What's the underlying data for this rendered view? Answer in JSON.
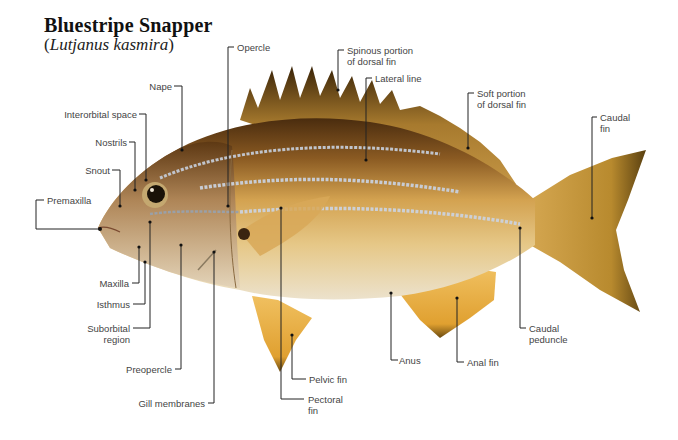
{
  "title": "Bluestripe Snapper",
  "subtitle_open": "(",
  "subtitle_species": "Lutjanus kasmira",
  "subtitle_close": ")",
  "labels": {
    "opercle": "Opercle",
    "spinous_dorsal_1": "Spinous portion",
    "spinous_dorsal_2": "of dorsal fin",
    "lateral_line": "Lateral line",
    "soft_dorsal_1": "Soft portion",
    "soft_dorsal_2": "of dorsal fin",
    "caudal_fin_1": "Caudal",
    "caudal_fin_2": "fin",
    "nape": "Nape",
    "interorbital": "Interorbital space",
    "nostrils": "Nostrils",
    "snout": "Snout",
    "premaxilla": "Premaxilla",
    "maxilla": "Maxilla",
    "isthmus": "Isthmus",
    "suborbital_1": "Suborbital",
    "suborbital_2": "region",
    "preopercle": "Preopercle",
    "gill_membranes": "Gill membranes",
    "pelvic_fin": "Pelvic fin",
    "pectoral_fin_1": "Pectoral",
    "pectoral_fin_2": "fin",
    "anus": "Anus",
    "anal_fin": "Anal fin",
    "caudal_peduncle_1": "Caudal",
    "caudal_peduncle_2": "peduncle"
  },
  "colors": {
    "body": "#d6a85a",
    "back": "#6b4518",
    "belly": "#e8dcc0",
    "fin": "#e2a83a",
    "stripe": "#c8ccd4",
    "leader": "#222222"
  }
}
